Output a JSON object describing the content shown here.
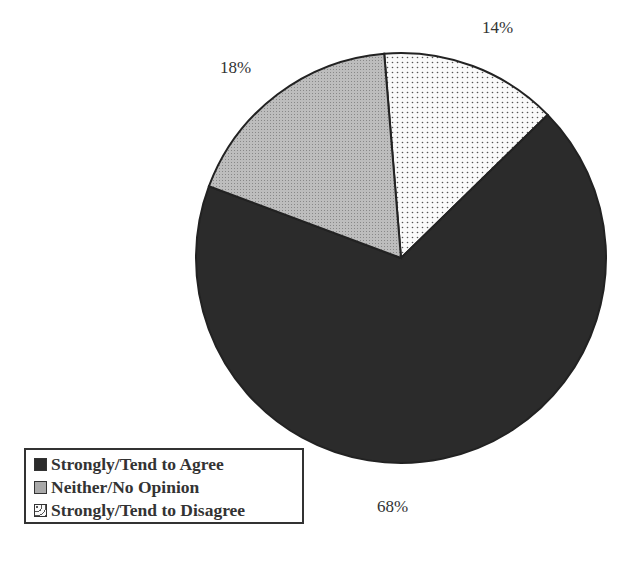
{
  "chart_data": {
    "type": "pie",
    "title": "",
    "categories": [
      "Strongly/Tend to Agree",
      "Neither/No Opinion",
      "Strongly/Tend to Disagree"
    ],
    "values": [
      68,
      18,
      14
    ],
    "labels": [
      "68%",
      "18%",
      "14%"
    ],
    "colors": [
      "#2b2b2b",
      "#b5b5b5",
      "#f4f4f4"
    ],
    "patterns": [
      "solid-dark",
      "fine-gray-stipple",
      "dotted"
    ],
    "start_angle_deg": -4.7,
    "legend_position": "bottom-left"
  },
  "labels": {
    "agree": "68%",
    "neither": "18%",
    "disagree": "14%"
  },
  "legend": {
    "items": [
      {
        "label": "Strongly/Tend to Agree",
        "color": "#2b2b2b"
      },
      {
        "label": "Neither/No Opinion",
        "color": "#b5b5b5"
      },
      {
        "label": "Strongly/Tend to Disagree",
        "color": "#f4f4f4"
      }
    ]
  }
}
